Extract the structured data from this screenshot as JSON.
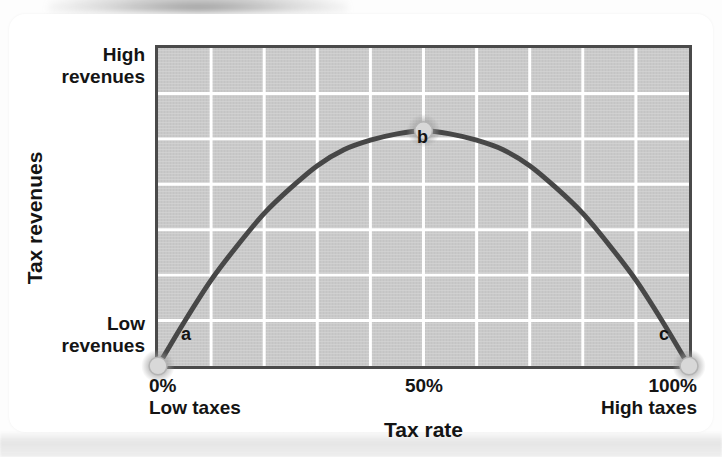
{
  "chart_data": {
    "type": "line",
    "title": "",
    "subtitle": "",
    "xlabel": "Tax rate",
    "ylabel": "Tax revenues",
    "xlim": [
      0,
      100
    ],
    "ylim": [
      0,
      100
    ],
    "grid": true,
    "grid_columns": 10,
    "grid_rows": 7,
    "legend": "none",
    "x_tick_labels": [
      "0%",
      "50%",
      "100%"
    ],
    "x_tick_sublabels": [
      "Low taxes",
      "",
      "High taxes"
    ],
    "y_tick_labels": [
      "High revenues",
      "Low revenues"
    ],
    "series": [
      {
        "name": "Laffer curve",
        "x": [
          0,
          5,
          10,
          15,
          20,
          25,
          30,
          35,
          40,
          45,
          50,
          55,
          60,
          65,
          70,
          75,
          80,
          85,
          90,
          95,
          100
        ],
        "values": [
          0,
          14,
          27,
          38,
          48,
          56,
          63,
          68,
          71,
          73,
          74,
          73,
          71,
          68,
          63,
          56,
          48,
          38,
          27,
          14,
          0
        ],
        "color": "#474747"
      }
    ],
    "annotations": [
      {
        "label": "a",
        "x": 0,
        "y": 0,
        "marker": true,
        "note": "zero tax rate, zero revenue"
      },
      {
        "label": "b",
        "x": 50,
        "y": 74,
        "marker": true,
        "note": "revenue-maximizing tax rate"
      },
      {
        "label": "c",
        "x": 100,
        "y": 0,
        "marker": true,
        "note": "100% tax rate, zero revenue"
      }
    ],
    "marker_color": "#d8d8d8",
    "plot_background": "#c9c9c9",
    "gridline_color": "#ffffff",
    "frame_color": "#4a4a4a"
  },
  "axes": {
    "y_title": "Tax revenues",
    "y_tick_high": "High\nrevenues",
    "y_tick_low": "Low\nrevenues",
    "x_title": "Tax rate",
    "x_tick_low": "0%\nLow taxes",
    "x_tick_mid": "50%",
    "x_tick_high": "100%\nHigh taxes"
  },
  "points": {
    "a": "a",
    "b": "b",
    "c": "c"
  }
}
